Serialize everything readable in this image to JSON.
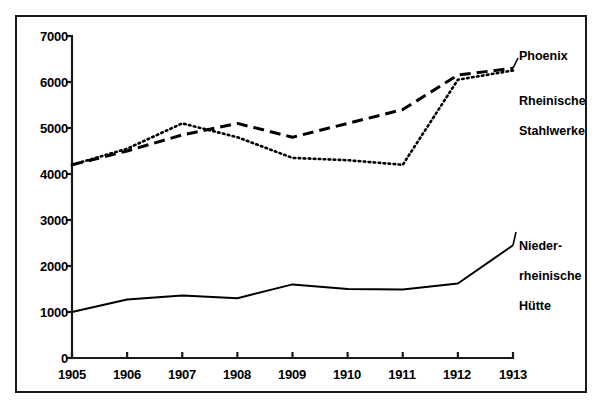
{
  "chart_data": {
    "type": "line",
    "title": "",
    "subtitle": "",
    "xlabel": "",
    "ylabel": "",
    "x": [
      1905,
      1906,
      1907,
      1908,
      1909,
      1910,
      1911,
      1912,
      1913
    ],
    "categories": [
      "1905",
      "1906",
      "1907",
      "1908",
      "1909",
      "1910",
      "1911",
      "1912",
      "1913"
    ],
    "xlim": [
      1905,
      1913
    ],
    "ylim": [
      0,
      7000
    ],
    "ytick_values": [
      0,
      1000,
      2000,
      3000,
      4000,
      5000,
      6000,
      7000
    ],
    "ytick_labels": [
      "0",
      "1000",
      "2000",
      "3000",
      "4000",
      "5000",
      "6000",
      "7000"
    ],
    "xtick_labels": [
      "1905",
      "1906",
      "1907",
      "1908",
      "1909",
      "1910",
      "1911",
      "1912",
      "1913"
    ],
    "grid": false,
    "legend_position": "right-inline-labels",
    "series": [
      {
        "name": "Phoenix",
        "style": "dashed",
        "label_lines": "Phoenix",
        "values": [
          4200,
          4500,
          4850,
          5100,
          4800,
          5100,
          5400,
          6150,
          6300
        ]
      },
      {
        "name": "Rheinische Stahlwerke",
        "style": "dotted",
        "label_lines": "Rheinische\nStahlwerke",
        "values": [
          4200,
          4550,
          5100,
          4800,
          4350,
          4300,
          4200,
          6050,
          6250
        ]
      },
      {
        "name": "Niederrheinische Hütte",
        "style": "solid",
        "label_lines": "Nieder-\nrheinische\nHütte",
        "values": [
          1000,
          1270,
          1360,
          1300,
          1600,
          1500,
          1490,
          1620,
          2450
        ]
      }
    ],
    "colors": {
      "axis": "#1a1a1a",
      "line": "#000000",
      "frame": "#1a1a1a",
      "background": "#ffffff"
    }
  },
  "labels": {
    "phoenix": "Phoenix",
    "rheinische_line1": "Rheinische",
    "rheinische_line2": "Stahlwerke",
    "nieder_line1": "Nieder-",
    "nieder_line2": "rheinische",
    "nieder_line3": "Hütte"
  }
}
